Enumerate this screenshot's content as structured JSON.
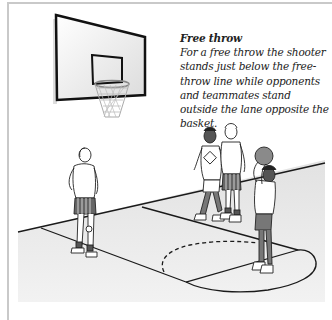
{
  "figure": {
    "caption": {
      "title": "Free throw",
      "body": "For a free throw the shooter stands just below the free-throw line while opponents and teammates stand outside the lane opposite the basket."
    },
    "elements": {
      "backboard": "basketball-backboard",
      "hoop": "basketball-hoop-net",
      "court": "half-court-floor",
      "free_throw_circle": "free-throw-circle-dashed",
      "players": [
        {
          "role": "teammate-waiting",
          "position": "left"
        },
        {
          "role": "opponent-defender",
          "position": "center"
        },
        {
          "role": "teammate",
          "position": "center-right"
        },
        {
          "role": "shooter",
          "position": "right",
          "holding": "ball"
        }
      ]
    },
    "colors": {
      "frame_border": "#c9c9c9",
      "floor": "#ececec",
      "lines": "#1a1a1a",
      "skin_dark": "#6b6b6b",
      "ball": "#8a8a8a"
    }
  }
}
